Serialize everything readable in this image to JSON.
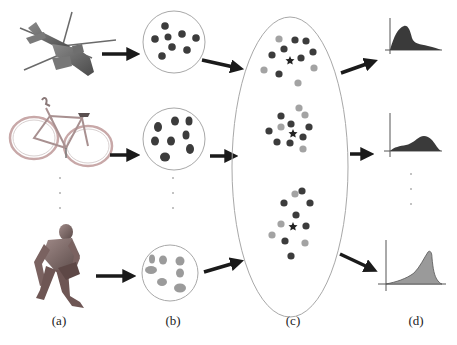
{
  "colors": {
    "dark_dot": "#3c3c3c",
    "light_dot": "#a3a3a3",
    "human_dot": "#9b9b9b",
    "outline": "#a8a8a8",
    "arrow": "#1a1a1a",
    "dist_dark": "#3a3a3a",
    "dist_light": "#9a9a9a",
    "axis": "#555555"
  },
  "captions": {
    "a": "(a)",
    "b": "(b)",
    "c": "(c)",
    "d": "(d)"
  },
  "column_a": {
    "objects": [
      {
        "name": "helicopter",
        "label": "helicopter 3D model"
      },
      {
        "name": "bicycle",
        "label": "bicycle 3D model"
      },
      {
        "name": "human",
        "label": "kneeling human 3D model"
      }
    ]
  },
  "column_b": {
    "sets": [
      {
        "name": "helicopter-features",
        "color": "dark",
        "count": 8
      },
      {
        "name": "bicycle-features",
        "color": "dark",
        "count": 8
      },
      {
        "name": "human-features",
        "color": "light",
        "count": 7
      }
    ]
  },
  "column_c": {
    "clusters": [
      {
        "name": "cluster-1",
        "center": "star",
        "dark_count": 9,
        "light_count": 4
      },
      {
        "name": "cluster-2",
        "center": "star",
        "dark_count": 8,
        "light_count": 4
      },
      {
        "name": "cluster-3",
        "center": "star",
        "dark_count": 9,
        "light_count": 4
      }
    ]
  },
  "column_d": {
    "distributions": [
      {
        "name": "distribution-1",
        "shape": "right-skewed, early peak",
        "fill": "dark"
      },
      {
        "name": "distribution-2",
        "shape": "broad peak right of center",
        "fill": "dark"
      },
      {
        "name": "distribution-3",
        "shape": "left-skewed, late sharp peak",
        "fill": "light"
      }
    ]
  },
  "ellipsis": "·"
}
